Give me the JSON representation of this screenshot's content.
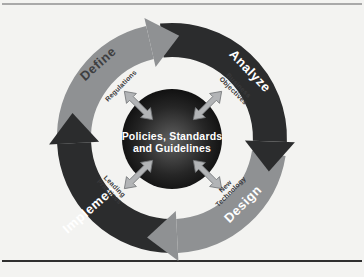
{
  "diagram": {
    "center": {
      "line1": "Policies, Standards",
      "line2": "and Guidelines"
    },
    "phases": {
      "define": "Define",
      "analyze": "Analyze",
      "design": "Design",
      "implement": "Implement"
    },
    "factors": {
      "regulations": {
        "line1": "Regulations",
        "line2": ""
      },
      "business_objectives": {
        "line1": "Business",
        "line2": "Objectives"
      },
      "new_technology": {
        "line1": "New",
        "line2": "Technology"
      },
      "leading_practices": {
        "line1": "Leading",
        "line2": "Practices"
      }
    }
  },
  "colors": {
    "background": "#f3f3f1",
    "band_gray": "#8f9193",
    "band_dark": "#2b2c2d",
    "phase_label_on_gray": "#3d3e40",
    "phase_label_on_dark": "#ffffff",
    "factor_label": "#39393b",
    "factor_arrow_fill": "#b2b4b6",
    "factor_arrow_stroke": "#737577",
    "center_text": "#ffffff",
    "core_glow": "#616161",
    "core_mid": "#262626",
    "core_edge": "#050505",
    "top_rule": "#909090",
    "bottom_rule": "#2f2f2f"
  }
}
